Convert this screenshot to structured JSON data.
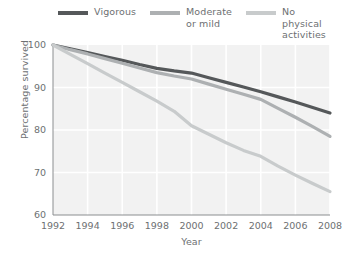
{
  "chart_data": {
    "type": "line",
    "title": "",
    "xlabel": "Year",
    "ylabel": "Percentage survived",
    "xlim": [
      1992,
      2008
    ],
    "ylim": [
      60,
      100
    ],
    "xticks": [
      1992,
      1994,
      1996,
      1998,
      2000,
      2002,
      2004,
      2006,
      2008
    ],
    "yticks": [
      60,
      70,
      80,
      90,
      100
    ],
    "grid": true,
    "grid_color": "#ffffff",
    "plot_background": "#f2f2f2",
    "legend_position": "top",
    "x": [
      1992,
      1993,
      1994,
      1995,
      1996,
      1997,
      1998,
      1999,
      2000,
      2001,
      2002,
      2003,
      2004,
      2005,
      2006,
      2007,
      2008
    ],
    "series": [
      {
        "name": "Vigorous",
        "color": "#55585a",
        "values": [
          100.0,
          99.1,
          98.2,
          97.3,
          96.4,
          95.4,
          94.5,
          93.9,
          93.4,
          92.3,
          91.2,
          90.1,
          89.0,
          87.8,
          86.6,
          85.3,
          84.0
        ]
      },
      {
        "name": "Moderate\nor mild",
        "color": "#adb0b2",
        "values": [
          100.0,
          98.9,
          97.9,
          96.8,
          95.7,
          94.6,
          93.5,
          92.7,
          92.0,
          90.8,
          89.6,
          88.4,
          87.2,
          85.1,
          83.0,
          80.8,
          78.5
        ]
      },
      {
        "name": "No physical\nactivities",
        "color": "#c8cbcc",
        "values": [
          100.0,
          97.8,
          95.6,
          93.4,
          91.2,
          89.0,
          86.8,
          84.4,
          81.0,
          79.0,
          77.0,
          75.2,
          73.8,
          71.5,
          69.4,
          67.4,
          65.5
        ]
      }
    ]
  },
  "legend": {
    "items": [
      {
        "label": "Vigorous",
        "color": "#55585a"
      },
      {
        "label": "Moderate\nor mild",
        "color": "#adb0b2"
      },
      {
        "label": "No physical\nactivities",
        "color": "#c8cbcc"
      }
    ]
  },
  "axes": {
    "y_title": "Percentage survived",
    "x_title": "Year"
  }
}
